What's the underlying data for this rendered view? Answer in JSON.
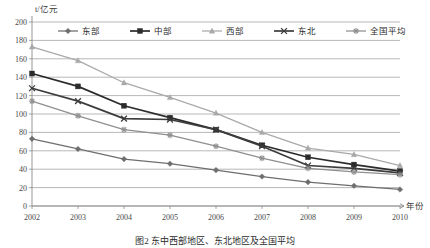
{
  "figure": {
    "y_unit_label": "t/亿元",
    "x_axis_label": "年份",
    "caption": "图2  东中西部地区、东北地区及全国平均"
  },
  "legend": {
    "position": "top-inside",
    "items": [
      {
        "label": "东部",
        "marker": "diamond",
        "color": "#6e6e6e"
      },
      {
        "label": "中部",
        "marker": "square",
        "color": "#2b2b2b"
      },
      {
        "label": "西部",
        "marker": "triangle",
        "color": "#a9a9a9"
      },
      {
        "label": "东北",
        "marker": "x-cross",
        "color": "#3d3d3d"
      },
      {
        "label": "全国平均",
        "marker": "asterisk",
        "color": "#8f8f8f"
      }
    ]
  },
  "chart_data": {
    "type": "line",
    "title": "",
    "subtitle": "",
    "xlabel": "年份",
    "ylabel": "t/亿元",
    "grid": true,
    "legend_position": "top",
    "categories": [
      "2002",
      "2003",
      "2004",
      "2005",
      "2006",
      "2007",
      "2008",
      "2009",
      "2010"
    ],
    "x": [
      2002,
      2003,
      2004,
      2005,
      2006,
      2007,
      2008,
      2009,
      2010
    ],
    "xlim": [
      2002,
      2010
    ],
    "ylim": [
      0,
      200
    ],
    "ytick_labels": [
      "0",
      "20",
      "40",
      "60",
      "80",
      "100",
      "120",
      "140",
      "160",
      "180",
      "200"
    ],
    "yticks": [
      0,
      20,
      40,
      60,
      80,
      100,
      120,
      140,
      160,
      180,
      200
    ],
    "series": [
      {
        "name": "东部",
        "marker": "diamond",
        "color": "#6e6e6e",
        "values": [
          73,
          62,
          51,
          46,
          39,
          32,
          26,
          22,
          18
        ]
      },
      {
        "name": "中部",
        "marker": "square",
        "color": "#2b2b2b",
        "values": [
          144,
          130,
          109,
          96,
          83,
          66,
          53,
          45,
          38
        ]
      },
      {
        "name": "西部",
        "marker": "triangle",
        "color": "#a9a9a9",
        "values": [
          173,
          158,
          134,
          118,
          101,
          80,
          63,
          56,
          44
        ]
      },
      {
        "name": "东北",
        "marker": "x-cross",
        "color": "#3d3d3d",
        "values": [
          128,
          114,
          95,
          94,
          83,
          65,
          44,
          41,
          36
        ]
      },
      {
        "name": "全国平均",
        "marker": "asterisk",
        "color": "#8f8f8f",
        "values": [
          114,
          98,
          83,
          77,
          65,
          52,
          41,
          37,
          34
        ]
      }
    ]
  }
}
